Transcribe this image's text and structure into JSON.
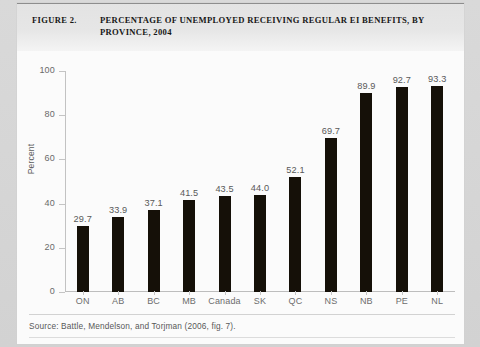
{
  "figure": {
    "label": "FIGURE 2.",
    "title": "PERCENTAGE OF UNEMPLOYED RECEIVING REGULAR EI BENEFITS, BY PROVINCE, 2004",
    "source_note": "Source: Battle, Mendelson, and Torjman (2006, fig. 7)."
  },
  "colors": {
    "bar": "#151008",
    "axis": "#c2c2c2",
    "tick_text": "#6a6a6a",
    "title_band": "#e6e6e6",
    "page": "#d6d6d6",
    "sheet": "#fbfbfb"
  },
  "chart_data": {
    "type": "bar",
    "title": "PERCENTAGE OF UNEMPLOYED RECEIVING REGULAR EI BENEFITS, BY PROVINCE, 2004",
    "xlabel": "",
    "ylabel": "Percent",
    "ylim": [
      0,
      100
    ],
    "yticks": [
      0,
      20,
      40,
      60,
      80,
      100
    ],
    "ytick_labels": [
      "0",
      "20",
      "40",
      "60",
      "80",
      "100"
    ],
    "grid": false,
    "legend": false,
    "data_labels": true,
    "categories": [
      "ON",
      "AB",
      "BC",
      "MB",
      "Canada",
      "SK",
      "QC",
      "NS",
      "NB",
      "PE",
      "NL"
    ],
    "values": [
      29.7,
      33.9,
      37.1,
      41.5,
      43.5,
      44.0,
      52.1,
      69.7,
      89.9,
      92.7,
      93.3
    ],
    "value_labels": [
      "29.7",
      "33.9",
      "37.1",
      "41.5",
      "43.5",
      "44.0",
      "52.1",
      "69.7",
      "89.9",
      "92.7",
      "93.3"
    ]
  }
}
